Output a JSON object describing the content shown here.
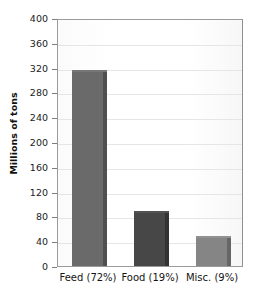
{
  "chart_data": {
    "type": "bar",
    "title": "",
    "xlabel": "",
    "ylabel": "Millions of tons",
    "categories": [
      "Feed (72%)",
      "Food (19%)",
      "Misc. (9%)"
    ],
    "values": [
      316,
      88,
      49
    ],
    "ylim": [
      0,
      400
    ],
    "yticks": [
      0,
      40,
      80,
      120,
      160,
      200,
      240,
      280,
      320,
      360,
      400
    ],
    "ytick_labels": [
      "0",
      "40",
      "80",
      "120",
      "160",
      "200",
      "240",
      "280",
      "320",
      "360",
      "400"
    ],
    "grid": true,
    "legend": "none",
    "series": [
      {
        "name": "Millions of tons",
        "values": [
          316,
          88,
          49
        ]
      }
    ],
    "bar_colors": [
      "#6a6a6a",
      "#474747",
      "#858585"
    ],
    "bar_side_colors": [
      "#4f4f4f",
      "#333333",
      "#666666"
    ],
    "bar_top_colors": [
      "#767676",
      "#525252",
      "#919191"
    ],
    "axis_color": "#9a9a9a",
    "grid_color": "#e6e6e6",
    "background": "#fdfdfd",
    "text_color": "#1a1a1a"
  },
  "axes": {
    "y_title": "Millions of tons"
  }
}
